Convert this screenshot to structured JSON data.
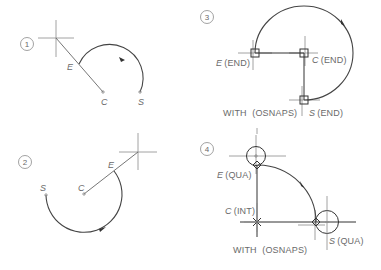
{
  "panels": [
    {
      "id": 1,
      "number_label": "1",
      "labels": {
        "end": "E",
        "center": "C",
        "start": "S"
      },
      "osnap_caption": ""
    },
    {
      "id": 2,
      "number_label": "2",
      "labels": {
        "end": "E",
        "center": "C",
        "start": "S"
      },
      "osnap_caption": ""
    },
    {
      "id": 3,
      "number_label": "3",
      "labels": {
        "end": "E",
        "end_snap": "(END)",
        "center": "C",
        "center_snap": "(END)",
        "start": "S",
        "start_snap": "(END)"
      },
      "osnap_caption": "WITH  (OSNAPS)"
    },
    {
      "id": 4,
      "number_label": "4",
      "labels": {
        "end": "E",
        "end_snap": "(QUA)",
        "center": "C",
        "center_snap": "(INT)",
        "start": "S",
        "start_snap": "(QUA)"
      },
      "osnap_caption": "WITH  (OSNAPS)"
    }
  ],
  "icons": {
    "crosshair": "crosshair-cursor-icon",
    "snap_box": "endpoint-snap-marker-icon",
    "snap_diamond": "quadrant-snap-marker-icon",
    "snap_x": "intersection-snap-marker-icon",
    "arrow": "arc-direction-arrow-icon"
  },
  "colors": {
    "text": "#6a6a6a",
    "arc": "#444444",
    "guide": "#8a8a8a"
  }
}
